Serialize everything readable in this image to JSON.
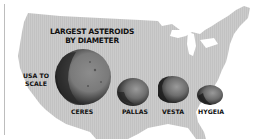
{
  "title_line1": "LARGEST ASTEROIDS",
  "title_line2": "BY DIAMETER",
  "scale_note_line1": "USA TO",
  "scale_note_line2": "SCALE",
  "asteroids": [
    {
      "name": "CERES",
      "rank": 1
    },
    {
      "name": "PALLAS",
      "rank": 2
    },
    {
      "name": "VESTA",
      "rank": 3
    },
    {
      "name": "HYGEIA",
      "rank": 4
    }
  ],
  "colors": {
    "map_fill": "#c8c8c8",
    "text": "#111111",
    "background": "#ffffff"
  }
}
